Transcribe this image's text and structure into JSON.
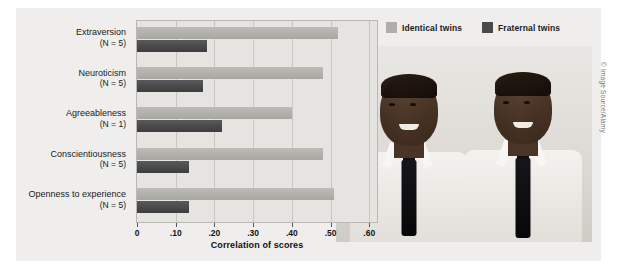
{
  "figure": {
    "credit_left": "© Cengage Learning 2013",
    "credit_right": "© Image Source/Alamy",
    "photo_alt": "Two identical twin young men in white shirts and dark ties"
  },
  "legend": {
    "position": "top-right",
    "items": [
      {
        "label": "Identical twins",
        "color": "#b0aeaa",
        "key": "identical"
      },
      {
        "label": "Fraternal twins",
        "color": "#4a494b",
        "key": "fraternal"
      }
    ]
  },
  "chart_data": {
    "type": "bar",
    "orientation": "horizontal",
    "title": "",
    "xlabel": "Correlation of scores",
    "ylabel": "",
    "xlim": [
      0,
      0.62
    ],
    "xticks": [
      0,
      0.1,
      0.2,
      0.3,
      0.4,
      0.5,
      0.6
    ],
    "xtick_labels": [
      "0",
      ".10",
      ".20",
      ".30",
      ".40",
      ".50",
      ".60"
    ],
    "grid": true,
    "legend_position": "upper right",
    "categories": [
      "Extraversion",
      "Neuroticism",
      "Agreeableness",
      "Conscientiousness",
      "Openness to experience"
    ],
    "category_sublabels": [
      "(N = 5)",
      "(N = 5)",
      "(N = 1)",
      "(N = 5)",
      "(N = 5)"
    ],
    "series": [
      {
        "name": "Identical twins",
        "color": "#b0aeaa",
        "values": [
          0.52,
          0.48,
          0.4,
          0.48,
          0.51
        ]
      },
      {
        "name": "Fraternal twins",
        "color": "#4a494b",
        "values": [
          0.18,
          0.17,
          0.22,
          0.135,
          0.135
        ]
      }
    ]
  }
}
